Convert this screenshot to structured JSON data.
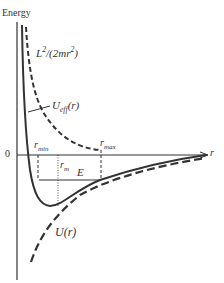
{
  "diagram": {
    "y_axis_label": "Energy",
    "x_axis_label": "r",
    "origin_label": "0",
    "curves": {
      "centrifugal": {
        "label_main": "L",
        "label_sup": "2",
        "label_rest": "/(2mr",
        "label_sup2": "2",
        "label_close": ")",
        "style": "dashed"
      },
      "effective": {
        "label_main": "U",
        "label_sub": "eff",
        "label_rest": "(r)",
        "style": "solid"
      },
      "potential": {
        "label": "U(r)",
        "style": "dashed"
      }
    },
    "markers": {
      "r_min": {
        "main": "r",
        "sub": "min"
      },
      "r_max": {
        "main": "r",
        "sub": "max"
      },
      "r_m": {
        "main": "r",
        "sub": "m"
      },
      "E": "E"
    },
    "colors": {
      "line": "#333333",
      "background": "#ffffff"
    }
  }
}
